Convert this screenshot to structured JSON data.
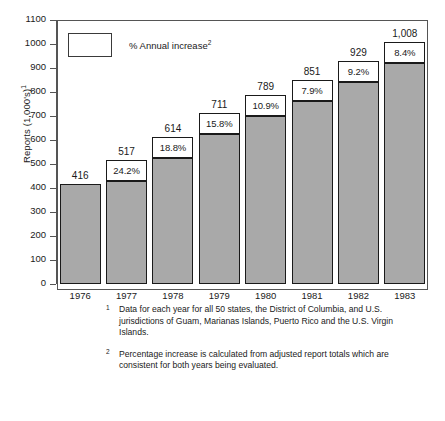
{
  "chart_data": {
    "type": "bar",
    "title": "",
    "subtitle": "",
    "xlabel": "",
    "ylabel": "Reports (1,000's)",
    "ylabel_superscript": "1",
    "ylim": [
      0,
      1100
    ],
    "ytick_step": 100,
    "yticks": [
      "1100",
      "1000",
      "900",
      "800",
      "700",
      "600",
      "500",
      "400",
      "300",
      "200",
      "100",
      "0"
    ],
    "grid": false,
    "legend_position": "top-left",
    "legend": [
      {
        "label": "% Annual increase",
        "label_superscript": "2",
        "swatch_fill": "#ffffff",
        "swatch_border": "#3a3a3a"
      }
    ],
    "categories": [
      "1976",
      "1977",
      "1978",
      "1979",
      "1980",
      "1981",
      "1982",
      "1983"
    ],
    "values": [
      416,
      517,
      614,
      711,
      789,
      851,
      929,
      1008
    ],
    "value_labels": [
      "416",
      "517",
      "614",
      "711",
      "789",
      "851",
      "929",
      "1,008"
    ],
    "annual_increase_pct": [
      null,
      24.2,
      18.8,
      15.8,
      10.9,
      7.9,
      9.2,
      8.4
    ],
    "annual_increase_labels": [
      "",
      "24.2%",
      "18.8%",
      "15.8%",
      "10.9%",
      "7.9%",
      "9.2%",
      "8.4%"
    ],
    "series": [
      {
        "name": "Reports (1,000's)",
        "values": [
          416,
          517,
          614,
          711,
          789,
          851,
          929,
          1008
        ]
      },
      {
        "name": "% Annual increase",
        "values": [
          null,
          24.2,
          18.8,
          15.8,
          10.9,
          7.9,
          9.2,
          8.4
        ]
      }
    ],
    "bar_fill_color": "#a9a9a9",
    "bar_border_color": "#1a1a1a",
    "pct_box_fill": "#ffffff"
  },
  "footnotes": [
    {
      "marker": "1",
      "text": "Data for each year for all 50 states, the District of Columbia, and U.S. jurisdictions of Guam, Marianas Islands, Puerto Rico and the U.S. Virgin Islands."
    },
    {
      "marker": "2",
      "text": "Percentage increase is calculated from adjusted report totals which are consistent for both years being evaluated."
    }
  ]
}
